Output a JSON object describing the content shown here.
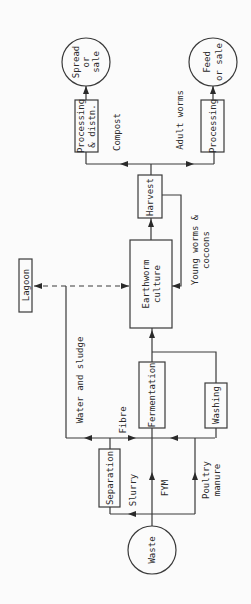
{
  "diagram": {
    "orientation": "rotated-90-ccw",
    "nodes": {
      "waste": "Waste",
      "separation": "Separation",
      "fermentation": "Fermentation",
      "washing": "Washing",
      "lagoon": "Lagoon",
      "earthworm_culture_1": "Earthworm",
      "earthworm_culture_2": "culture",
      "harvest": "Harvest",
      "processing_distn_1": "Processing",
      "processing_distn_2": "& distn.",
      "processing": "Processing",
      "spread_1": "Spread",
      "spread_2": "or",
      "spread_3": "sale",
      "feed_1": "Feed",
      "feed_2": "or sale"
    },
    "edges": {
      "slurry": "Slurry",
      "fym": "FYM",
      "poultry_1": "Poultry",
      "poultry_2": "manure",
      "water_sludge": "Water and sludge",
      "fibre": "Fibre",
      "young_1": "Young worms &",
      "young_2": "cocoons",
      "compost": "Compost",
      "adult": "Adult worms"
    }
  }
}
